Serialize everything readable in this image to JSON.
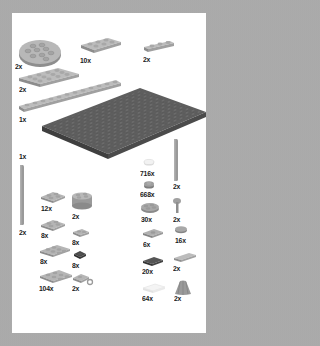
{
  "page": {
    "type": "LEGO parts inventory",
    "background_color": "#a9a9a9",
    "panel_color": "#ffffff"
  },
  "colors": {
    "light_gray": "#b5b5b5",
    "medium_gray": "#9a9a9a",
    "dark_gray": "#5e5e5e",
    "darker_gray": "#4a4a4a",
    "white": "#f2f2f2",
    "text": "#1a1a1a"
  },
  "parts": [
    {
      "id": "round-plate-4x4",
      "label": "2x",
      "color": "light_gray"
    },
    {
      "id": "plate-2x3",
      "label": "10x",
      "color": "light_gray"
    },
    {
      "id": "plate-1x3",
      "label": "2x",
      "color": "light_gray"
    },
    {
      "id": "plate-4x4",
      "label": "2x",
      "color": "light_gray"
    },
    {
      "id": "plate-1x12",
      "label": "1x",
      "color": "light_gray"
    },
    {
      "id": "baseplate-16x16",
      "label": "",
      "color": "dark_gray"
    },
    {
      "id": "bar-long",
      "label": "1x",
      "color": "medium_gray"
    },
    {
      "id": "bar-long-pair",
      "label": "2x",
      "color": "medium_gray"
    },
    {
      "id": "plate-2x2-a",
      "label": "12x",
      "color": "light_gray"
    },
    {
      "id": "round-brick-2x2",
      "label": "2x",
      "color": "light_gray"
    },
    {
      "id": "plate-2x2-b",
      "label": "8x",
      "color": "light_gray"
    },
    {
      "id": "plate-1x2",
      "label": "8x",
      "color": "light_gray"
    },
    {
      "id": "plate-2x3-b",
      "label": "8x",
      "color": "light_gray"
    },
    {
      "id": "plate-1x1-dark",
      "label": "8x",
      "color": "darker_gray"
    },
    {
      "id": "plate-2x4",
      "label": "104x",
      "color": "light_gray"
    },
    {
      "id": "plate-clip",
      "label": "2x",
      "color": "light_gray"
    },
    {
      "id": "round-tile-1x1-trans",
      "label": "716x",
      "color": "white"
    },
    {
      "id": "round-plate-1x1",
      "label": "668x",
      "color": "medium_gray"
    },
    {
      "id": "bar-vertical",
      "label": "2x",
      "color": "medium_gray"
    },
    {
      "id": "round-plate-2x2-flower",
      "label": "30x",
      "color": "medium_gray"
    },
    {
      "id": "lever-stick",
      "label": "2x",
      "color": "medium_gray"
    },
    {
      "id": "jumper-plate-1x2",
      "label": "6x",
      "color": "medium_gray"
    },
    {
      "id": "round-tile-2x2",
      "label": "16x",
      "color": "medium_gray"
    },
    {
      "id": "tile-1x2-dark",
      "label": "20x",
      "color": "darker_gray"
    },
    {
      "id": "tile-1x3",
      "label": "2x",
      "color": "light_gray"
    },
    {
      "id": "tile-1x2-white",
      "label": "64x",
      "color": "white"
    },
    {
      "id": "cape-wing",
      "label": "2x",
      "color": "medium_gray"
    }
  ]
}
